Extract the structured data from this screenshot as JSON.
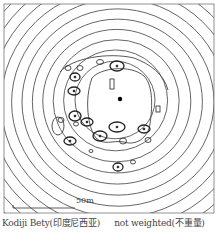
{
  "figure": {
    "scale_bar": {
      "label": "50m",
      "x1": 13,
      "x2": 75,
      "y": 208
    },
    "center_point": {
      "x": 120,
      "y": 99
    },
    "border": {
      "x": 4,
      "y": 4,
      "w": 210,
      "h": 209
    },
    "colors": {
      "line": "#555555",
      "border": "#777777",
      "background": "#ffffff"
    },
    "contour_center": {
      "x": 115,
      "y": 100
    },
    "contour_radii": [
      40,
      52,
      63,
      74,
      85,
      96,
      107,
      118,
      129,
      140,
      151,
      162,
      173
    ],
    "dotted_ovals": [
      {
        "x": 117,
        "y": 66,
        "rx": 7,
        "ry": 5
      },
      {
        "x": 75,
        "y": 77,
        "rx": 5,
        "ry": 4
      },
      {
        "x": 74,
        "y": 91,
        "rx": 6,
        "ry": 4
      },
      {
        "x": 75,
        "y": 116,
        "rx": 6,
        "ry": 5
      },
      {
        "x": 87,
        "y": 122,
        "rx": 6,
        "ry": 4
      },
      {
        "x": 117,
        "y": 127,
        "rx": 8,
        "ry": 5
      },
      {
        "x": 144,
        "y": 129,
        "rx": 6,
        "ry": 4
      },
      {
        "x": 100,
        "y": 136,
        "rx": 7,
        "ry": 5
      },
      {
        "x": 70,
        "y": 141,
        "rx": 6,
        "ry": 4
      },
      {
        "x": 118,
        "y": 167,
        "rx": 5,
        "ry": 4
      }
    ],
    "open_ovals": [
      {
        "x": 100,
        "y": 62,
        "rx": 3.5,
        "ry": 2.5
      },
      {
        "x": 68,
        "y": 68,
        "rx": 3,
        "ry": 2.5
      },
      {
        "x": 80,
        "y": 68,
        "rx": 3,
        "ry": 2.5
      },
      {
        "x": 61,
        "y": 120,
        "rx": 3,
        "ry": 2.5
      },
      {
        "x": 76,
        "y": 124,
        "rx": 2.5,
        "ry": 2
      },
      {
        "x": 123,
        "y": 141,
        "rx": 3.5,
        "ry": 3
      },
      {
        "x": 148,
        "y": 140,
        "rx": 3,
        "ry": 2.5
      },
      {
        "x": 91,
        "y": 151,
        "rx": 2,
        "ry": 1.5
      },
      {
        "x": 133,
        "y": 162,
        "rx": 2.5,
        "ry": 2
      }
    ],
    "large_open_oval": {
      "x": 58,
      "y": 126,
      "rx": 6,
      "ry": 9
    },
    "rect_markers": [
      {
        "x": 110,
        "y": 79,
        "w": 4,
        "h": 10
      },
      {
        "x": 156,
        "y": 106,
        "w": 4,
        "h": 6
      }
    ]
  },
  "caption": {
    "left": "Kodiji Bety(印度尼西亚)",
    "right": "not weighted(不重量)"
  }
}
